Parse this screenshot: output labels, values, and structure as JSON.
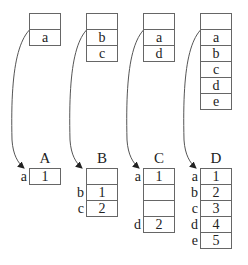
{
  "diagram": {
    "shapes": [
      {
        "name": "A",
        "x": 29,
        "header_cells": [
          "",
          "a"
        ],
        "table": [
          {
            "key": "a",
            "value": "1"
          }
        ]
      },
      {
        "name": "B",
        "x": 86,
        "header_cells": [
          "",
          "b",
          "c"
        ],
        "table": [
          {
            "key": "",
            "value": ""
          },
          {
            "key": "b",
            "value": "1"
          },
          {
            "key": "c",
            "value": "2"
          }
        ]
      },
      {
        "name": "C",
        "x": 143,
        "header_cells": [
          "",
          "a",
          "d"
        ],
        "table": [
          {
            "key": "a",
            "value": "1"
          },
          {
            "key": "",
            "value": ""
          },
          {
            "key": "",
            "value": ""
          },
          {
            "key": "d",
            "value": "2"
          }
        ]
      },
      {
        "name": "D",
        "x": 200,
        "header_cells": [
          "",
          "a",
          "b",
          "c",
          "d",
          "e"
        ],
        "table": [
          {
            "key": "a",
            "value": "1"
          },
          {
            "key": "b",
            "value": "2"
          },
          {
            "key": "c",
            "value": "3"
          },
          {
            "key": "d",
            "value": "4"
          },
          {
            "key": "e",
            "value": "5"
          }
        ]
      }
    ]
  }
}
